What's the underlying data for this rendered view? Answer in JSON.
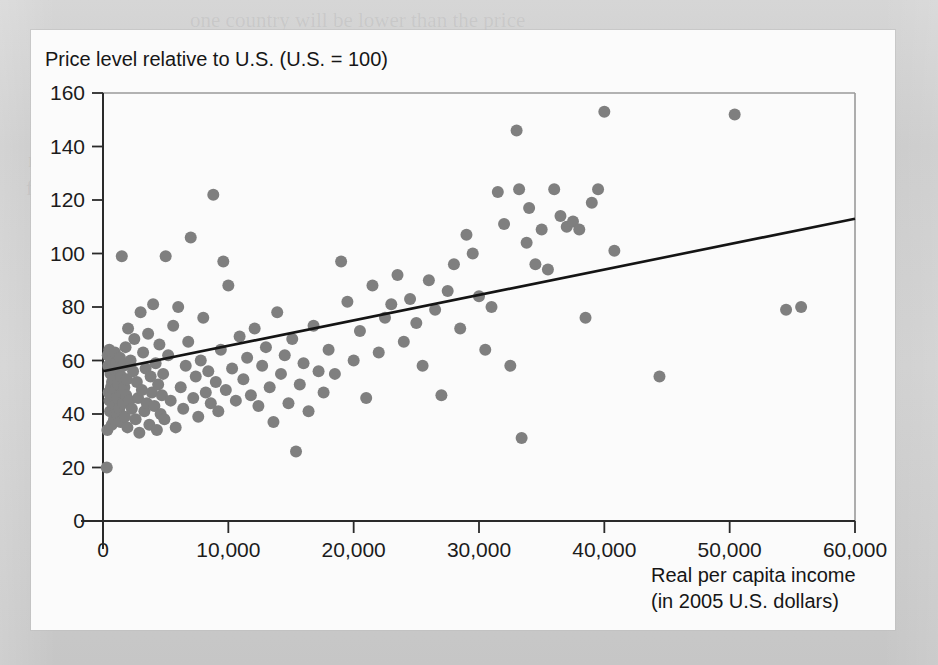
{
  "chart_data": {
    "type": "scatter",
    "title": "",
    "ylabel": "Price level relative to U.S. (U.S. = 100)",
    "xlabel_line1": "Real per capita income",
    "xlabel_line2": "(in 2005 U.S. dollars)",
    "xlim": [
      0,
      60000
    ],
    "ylim": [
      0,
      160
    ],
    "x_ticks": [
      0,
      10000,
      20000,
      30000,
      40000,
      50000,
      60000
    ],
    "x_tick_labels": [
      "0",
      "10,000",
      "20,000",
      "30,000",
      "40,000",
      "50,000",
      "60,000"
    ],
    "y_ticks": [
      0,
      20,
      40,
      60,
      80,
      100,
      120,
      140,
      160
    ],
    "y_tick_labels": [
      "0",
      "20",
      "40",
      "60",
      "80",
      "100",
      "120",
      "140",
      "160"
    ],
    "grid": false,
    "legend": "none",
    "marker_color": "#7f7f7f",
    "marker_radius": 6,
    "trendline": {
      "label": "fitted regression line",
      "color": "#141414",
      "x_start": 0,
      "y_start": 56,
      "x_end": 60000,
      "y_end": 113
    },
    "points": [
      [
        300,
        20
      ],
      [
        350,
        34
      ],
      [
        380,
        62
      ],
      [
        420,
        58
      ],
      [
        450,
        48
      ],
      [
        500,
        64
      ],
      [
        520,
        45
      ],
      [
        560,
        41
      ],
      [
        600,
        55
      ],
      [
        640,
        50
      ],
      [
        680,
        60
      ],
      [
        700,
        36
      ],
      [
        720,
        52
      ],
      [
        760,
        44
      ],
      [
        800,
        57
      ],
      [
        840,
        47
      ],
      [
        880,
        38
      ],
      [
        900,
        53
      ],
      [
        950,
        63
      ],
      [
        980,
        43
      ],
      [
        1000,
        49
      ],
      [
        1050,
        59
      ],
      [
        1100,
        40
      ],
      [
        1150,
        46
      ],
      [
        1200,
        51
      ],
      [
        1250,
        56
      ],
      [
        1300,
        42
      ],
      [
        1350,
        61
      ],
      [
        1400,
        37
      ],
      [
        1450,
        54
      ],
      [
        1500,
        99
      ],
      [
        1550,
        48
      ],
      [
        1600,
        44
      ],
      [
        1650,
        58
      ],
      [
        1700,
        50
      ],
      [
        1750,
        39
      ],
      [
        1800,
        65
      ],
      [
        1850,
        47
      ],
      [
        1900,
        53
      ],
      [
        1950,
        35
      ],
      [
        2000,
        72
      ],
      [
        2100,
        45
      ],
      [
        2200,
        60
      ],
      [
        2300,
        42
      ],
      [
        2400,
        56
      ],
      [
        2500,
        68
      ],
      [
        2600,
        38
      ],
      [
        2700,
        52
      ],
      [
        2800,
        46
      ],
      [
        2900,
        33
      ],
      [
        3000,
        78
      ],
      [
        3100,
        49
      ],
      [
        3200,
        63
      ],
      [
        3300,
        41
      ],
      [
        3400,
        57
      ],
      [
        3500,
        44
      ],
      [
        3600,
        70
      ],
      [
        3700,
        36
      ],
      [
        3800,
        54
      ],
      [
        3900,
        48
      ],
      [
        4000,
        81
      ],
      [
        4100,
        43
      ],
      [
        4200,
        59
      ],
      [
        4300,
        34
      ],
      [
        4400,
        51
      ],
      [
        4500,
        66
      ],
      [
        4600,
        40
      ],
      [
        4700,
        47
      ],
      [
        4800,
        55
      ],
      [
        4900,
        38
      ],
      [
        5000,
        99
      ],
      [
        5200,
        62
      ],
      [
        5400,
        45
      ],
      [
        5600,
        73
      ],
      [
        5800,
        35
      ],
      [
        6000,
        80
      ],
      [
        6200,
        50
      ],
      [
        6400,
        42
      ],
      [
        6600,
        58
      ],
      [
        6800,
        67
      ],
      [
        7000,
        106
      ],
      [
        7200,
        46
      ],
      [
        7400,
        54
      ],
      [
        7600,
        39
      ],
      [
        7800,
        60
      ],
      [
        8000,
        76
      ],
      [
        8200,
        48
      ],
      [
        8400,
        56
      ],
      [
        8600,
        44
      ],
      [
        8800,
        122
      ],
      [
        9000,
        52
      ],
      [
        9200,
        41
      ],
      [
        9400,
        64
      ],
      [
        9600,
        97
      ],
      [
        9800,
        49
      ],
      [
        10000,
        88
      ],
      [
        10300,
        57
      ],
      [
        10600,
        45
      ],
      [
        10900,
        69
      ],
      [
        11200,
        53
      ],
      [
        11500,
        61
      ],
      [
        11800,
        47
      ],
      [
        12100,
        72
      ],
      [
        12400,
        43
      ],
      [
        12700,
        58
      ],
      [
        13000,
        65
      ],
      [
        13300,
        50
      ],
      [
        13600,
        37
      ],
      [
        13900,
        78
      ],
      [
        14200,
        55
      ],
      [
        14500,
        62
      ],
      [
        14800,
        44
      ],
      [
        15100,
        68
      ],
      [
        15400,
        26
      ],
      [
        15700,
        51
      ],
      [
        16000,
        59
      ],
      [
        16400,
        41
      ],
      [
        16800,
        73
      ],
      [
        17200,
        56
      ],
      [
        17600,
        48
      ],
      [
        18000,
        64
      ],
      [
        18500,
        55
      ],
      [
        19000,
        97
      ],
      [
        19500,
        82
      ],
      [
        20000,
        60
      ],
      [
        20500,
        71
      ],
      [
        21000,
        46
      ],
      [
        21500,
        88
      ],
      [
        22000,
        63
      ],
      [
        22500,
        76
      ],
      [
        23000,
        81
      ],
      [
        23500,
        92
      ],
      [
        24000,
        67
      ],
      [
        24500,
        83
      ],
      [
        25000,
        74
      ],
      [
        25500,
        58
      ],
      [
        26000,
        90
      ],
      [
        26500,
        79
      ],
      [
        27000,
        47
      ],
      [
        27500,
        86
      ],
      [
        28000,
        96
      ],
      [
        28500,
        72
      ],
      [
        29000,
        107
      ],
      [
        29500,
        100
      ],
      [
        30000,
        84
      ],
      [
        30500,
        64
      ],
      [
        31000,
        80
      ],
      [
        31500,
        123
      ],
      [
        32000,
        111
      ],
      [
        32500,
        58
      ],
      [
        33000,
        146
      ],
      [
        33200,
        124
      ],
      [
        33400,
        31
      ],
      [
        33800,
        104
      ],
      [
        34000,
        117
      ],
      [
        34500,
        96
      ],
      [
        35000,
        109
      ],
      [
        35500,
        94
      ],
      [
        36000,
        124
      ],
      [
        36500,
        114
      ],
      [
        37000,
        110
      ],
      [
        37500,
        112
      ],
      [
        38000,
        109
      ],
      [
        38500,
        76
      ],
      [
        39000,
        119
      ],
      [
        39500,
        124
      ],
      [
        40000,
        153
      ],
      [
        40800,
        101
      ],
      [
        44400,
        54
      ],
      [
        50400,
        152
      ],
      [
        54500,
        79
      ],
      [
        55700,
        80
      ]
    ]
  },
  "ghost_lines": [
    {
      "text": "one country will be lower than the price",
      "x": 190,
      "y": 6
    },
    {
      "text": "results of Canada and other sources.",
      "x": 196,
      "y": 34
    },
    {
      "text": "level another country. Relative price levels in each year",
      "x": 52,
      "y": 62
    },
    {
      "text": "countries and can be measured quite reliably over time",
      "x": 60,
      "y": 90
    },
    {
      "text": "relative to current discount data shown as long term price",
      "x": 36,
      "y": 118
    },
    {
      "text": "must be disclosed relative to the U.S. index with some of them",
      "x": 28,
      "y": 146
    },
    {
      "text": "further still the relative price of other wage levels than the wage level that",
      "x": 26,
      "y": 174
    },
    {
      "text": "the national income sources, and then the level differs among countries",
      "x": 38,
      "y": 202
    },
    {
      "text": "which is the same. The difference in the price level in the world",
      "x": 52,
      "y": 230
    },
    {
      "text": "some children on the one side of the border",
      "x": 88,
      "y": 258
    },
    {
      "text": "a short, the same as a result, a result",
      "x": 116,
      "y": 286
    },
    {
      "text": "the explanation of the simple price relation",
      "x": 100,
      "y": 314
    }
  ]
}
